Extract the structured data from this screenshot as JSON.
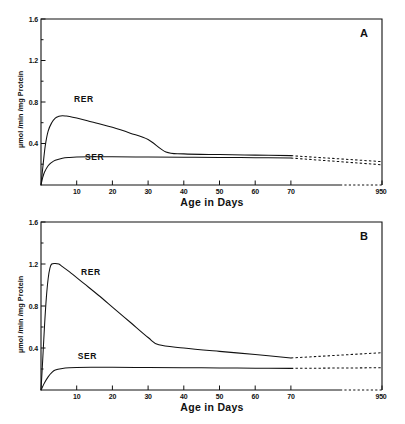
{
  "figure": {
    "panels": [
      {
        "id": "A",
        "letter": "A",
        "xlabel": "Age in Days",
        "ylabel": "µmol /min /mg Protein"
      },
      {
        "id": "B",
        "letter": "B",
        "xlabel": "Age in Days",
        "ylabel": "µmol /min /mg Protein"
      }
    ]
  },
  "chart_data": [
    {
      "type": "line",
      "panel": "A",
      "title": "",
      "xlabel": "Age in Days",
      "ylabel": "µmol /min /mg Protein",
      "xlim": [
        0,
        95
      ],
      "ylim": [
        0,
        1.6
      ],
      "xticks": [
        10,
        20,
        30,
        40,
        50,
        60,
        70,
        950
      ],
      "xticklabels": [
        "10",
        "20",
        "30",
        "40",
        "50",
        "60",
        "70",
        "950"
      ],
      "yticks": [
        0.4,
        0.8,
        1.2,
        1.6
      ],
      "yticklabels": [
        "0.4",
        "0.8",
        "1.2",
        "1.6"
      ],
      "axis_break": {
        "after": 70,
        "before": 950,
        "style": "dashed"
      },
      "grid": false,
      "legend": "inline-labels",
      "series": [
        {
          "name": "RER",
          "label_position": {
            "x": 12,
            "y": 0.8
          },
          "x": [
            0,
            0.6,
            1.2,
            2,
            3,
            4,
            5,
            6,
            7,
            8,
            10,
            13,
            16,
            20,
            25,
            30,
            35,
            40,
            50,
            60,
            70
          ],
          "values": [
            0.0,
            0.2,
            0.38,
            0.52,
            0.6,
            0.645,
            0.662,
            0.668,
            0.665,
            0.66,
            0.645,
            0.62,
            0.592,
            0.556,
            0.5,
            0.438,
            0.318,
            0.3,
            0.293,
            0.288,
            0.283
          ],
          "extrapolated": {
            "x": [
              70,
              950
            ],
            "values": [
              0.283,
              0.225
            ],
            "style": "dashed"
          }
        },
        {
          "name": "SER",
          "label_position": {
            "x": 15,
            "y": 0.24
          },
          "x": [
            0,
            0.5,
            1,
            2,
            3,
            4,
            6,
            8,
            10,
            14,
            20,
            30,
            40,
            50,
            60,
            70
          ],
          "values": [
            0.0,
            0.075,
            0.125,
            0.185,
            0.218,
            0.238,
            0.258,
            0.266,
            0.27,
            0.272,
            0.272,
            0.27,
            0.268,
            0.266,
            0.263,
            0.26
          ],
          "extrapolated": {
            "x": [
              70,
              950
            ],
            "values": [
              0.26,
              0.195
            ],
            "style": "dashed"
          }
        }
      ]
    },
    {
      "type": "line",
      "panel": "B",
      "title": "",
      "xlabel": "Age in Days",
      "ylabel": "µmol /min /mg Protein",
      "xlim": [
        0,
        95
      ],
      "ylim": [
        0,
        1.6
      ],
      "xticks": [
        10,
        20,
        30,
        40,
        50,
        60,
        70,
        950
      ],
      "xticklabels": [
        "10",
        "20",
        "30",
        "40",
        "50",
        "60",
        "70",
        "950"
      ],
      "yticks": [
        0.4,
        0.8,
        1.2,
        1.6
      ],
      "yticklabels": [
        "0.4",
        "0.8",
        "1.2",
        "1.6"
      ],
      "axis_break": {
        "after": 70,
        "before": 950,
        "style": "dashed"
      },
      "grid": false,
      "legend": "inline-labels",
      "series": [
        {
          "name": "RER",
          "label_position": {
            "x": 14,
            "y": 1.1
          },
          "x": [
            0,
            0.5,
            1,
            1.5,
            2,
            2.5,
            3,
            4,
            5,
            6,
            8,
            12,
            16,
            20,
            25,
            30,
            33,
            40,
            50,
            60,
            70
          ],
          "values": [
            0.0,
            0.3,
            0.62,
            0.88,
            1.06,
            1.16,
            1.2,
            1.205,
            1.2,
            1.175,
            1.125,
            1.015,
            0.905,
            0.79,
            0.645,
            0.5,
            0.43,
            0.4,
            0.368,
            0.338,
            0.305
          ],
          "extrapolated": {
            "x": [
              70,
              950
            ],
            "values": [
              0.305,
              0.355
            ],
            "style": "dashed"
          }
        },
        {
          "name": "SER",
          "label_position": {
            "x": 13,
            "y": 0.3
          },
          "x": [
            0,
            0.5,
            1,
            2,
            3,
            4,
            6,
            8,
            10,
            14,
            20,
            30,
            40,
            50,
            60,
            70
          ],
          "values": [
            0.0,
            0.035,
            0.07,
            0.125,
            0.165,
            0.19,
            0.205,
            0.212,
            0.215,
            0.216,
            0.216,
            0.214,
            0.212,
            0.21,
            0.208,
            0.206
          ],
          "extrapolated": {
            "x": [
              70,
              950
            ],
            "values": [
              0.206,
              0.212
            ],
            "style": "dashed"
          }
        }
      ]
    }
  ]
}
